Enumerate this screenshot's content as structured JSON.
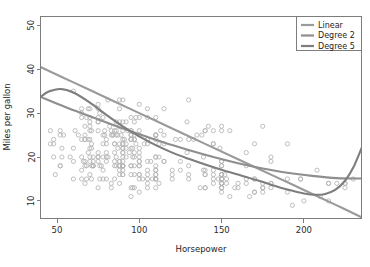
{
  "chart_data": {
    "type": "scatter",
    "title": "",
    "xlabel": "Horsepower",
    "ylabel": "Miles per gallon",
    "xlim": [
      40,
      235
    ],
    "ylim": [
      6,
      52
    ],
    "xticks": [
      50,
      100,
      150,
      200
    ],
    "yticks": [
      10,
      20,
      30,
      40,
      50
    ],
    "xtick_labels": [
      "50",
      "100",
      "150",
      "200"
    ],
    "ytick_labels": [
      "10",
      "20",
      "30",
      "40",
      "50"
    ],
    "grid": false,
    "legend_position": "top-right",
    "point_style": "open-circle",
    "point_color": "#b4b4b4",
    "scatter": {
      "name": "Auto observations",
      "x": [
        130,
        165,
        150,
        150,
        140,
        198,
        220,
        215,
        225,
        190,
        170,
        160,
        150,
        225,
        95,
        95,
        97,
        85,
        88,
        46,
        87,
        90,
        95,
        113,
        90,
        215,
        200,
        210,
        193,
        88,
        90,
        95,
        100,
        105,
        100,
        88,
        100,
        165,
        175,
        153,
        150,
        180,
        170,
        175,
        110,
        72,
        100,
        88,
        86,
        90,
        70,
        76,
        65,
        69,
        60,
        70,
        95,
        80,
        54,
        90,
        86,
        165,
        175,
        150,
        153,
        150,
        208,
        155,
        160,
        190,
        97,
        150,
        130,
        140,
        150,
        112,
        76,
        87,
        69,
        86,
        92,
        97,
        80,
        88,
        175,
        150,
        145,
        137,
        150,
        198,
        150,
        158,
        150,
        215,
        225,
        175,
        105,
        100,
        100,
        88,
        95,
        46,
        150,
        167,
        170,
        180,
        100,
        88,
        72,
        94,
        90,
        85,
        107,
        90,
        145,
        230,
        49,
        75,
        91,
        112,
        150,
        110,
        122,
        180,
        95,
        100,
        100,
        67,
        80,
        65,
        75,
        100,
        110,
        105,
        140,
        150,
        150,
        140,
        150,
        83,
        67,
        78,
        52,
        61,
        75,
        75,
        75,
        97,
        93,
        67,
        95,
        105,
        72,
        72,
        170,
        145,
        150,
        148,
        110,
        105,
        110,
        95,
        110,
        110,
        129,
        75,
        83,
        100,
        78,
        96,
        71,
        97,
        97,
        70,
        90,
        95,
        88,
        98,
        115,
        53,
        86,
        81,
        92,
        79,
        83,
        140,
        150,
        120,
        152,
        100,
        105,
        81,
        90,
        52,
        60,
        70,
        53,
        100,
        78,
        110,
        95,
        71,
        70,
        75,
        72,
        102,
        150,
        88,
        108,
        120,
        180,
        145,
        130,
        150,
        68,
        80,
        58,
        96,
        70,
        145,
        110,
        145,
        130,
        110,
        105,
        100,
        98,
        180,
        170,
        190,
        149,
        78,
        88,
        75,
        89,
        63,
        83,
        67,
        78,
        97,
        110,
        110,
        48,
        66,
        52,
        70,
        60,
        110,
        140,
        139,
        105,
        95,
        85,
        88,
        100,
        90,
        105,
        85,
        110,
        120,
        145,
        165,
        139,
        140,
        68,
        95,
        97,
        75,
        95,
        105,
        85,
        97,
        103,
        125,
        115,
        133,
        71,
        68,
        115,
        85,
        88,
        90,
        110,
        130,
        129,
        138,
        135,
        155,
        142,
        125,
        150,
        71,
        65,
        80,
        80,
        77,
        125,
        71,
        90,
        70,
        70,
        65,
        69,
        90,
        115,
        115,
        90,
        76,
        60,
        70,
        65,
        90,
        88,
        90,
        90,
        78,
        90,
        75,
        92,
        75,
        65,
        105,
        65,
        48,
        48,
        67,
        67,
        67,
        110,
        85,
        92,
        112,
        96,
        84,
        90,
        86,
        52,
        84,
        79,
        82
      ],
      "y": [
        18,
        15,
        18,
        16,
        17,
        15,
        14,
        14,
        14,
        15,
        15,
        14,
        15,
        14,
        24,
        22,
        18,
        21,
        27,
        26,
        25,
        24,
        25,
        26,
        21,
        10,
        10,
        11,
        9,
        27,
        28,
        25,
        25,
        19,
        16,
        17,
        19,
        18,
        14,
        14,
        14,
        14,
        12,
        13,
        13,
        18,
        22,
        19,
        18,
        23,
        28,
        30,
        30,
        31,
        35,
        27,
        26,
        24,
        25,
        23,
        20,
        21,
        13,
        14,
        15,
        14,
        17,
        11,
        13,
        12,
        13,
        19,
        15,
        13,
        13,
        14,
        18,
        22,
        21,
        26,
        22,
        28,
        23,
        28,
        27,
        13,
        14,
        13,
        14,
        15,
        12,
        13,
        13,
        14,
        13,
        12,
        13,
        18,
        16,
        18,
        18,
        23,
        26,
        11,
        12,
        13,
        12,
        18,
        20,
        21,
        22,
        18,
        19,
        21,
        26,
        15,
        16,
        29,
        24,
        20,
        19,
        15,
        24,
        20,
        11,
        20,
        21,
        19,
        15,
        31,
        26,
        32,
        25,
        16,
        16,
        18,
        16,
        13,
        14,
        14,
        14,
        29,
        26,
        26,
        31,
        32,
        28,
        24,
        26,
        24,
        26,
        31,
        19,
        18,
        15,
        15,
        16,
        15,
        16,
        14,
        17,
        16,
        15,
        18,
        21,
        20,
        13,
        29,
        23,
        20,
        23,
        24,
        25,
        24,
        18,
        29,
        19,
        23,
        23,
        22,
        25,
        33,
        28,
        25,
        25,
        26,
        27,
        17,
        16,
        15,
        17,
        20,
        19,
        18,
        19,
        22,
        20,
        26,
        20,
        24,
        24,
        26,
        31,
        19,
        18,
        15,
        15,
        16,
        15,
        16,
        14,
        17,
        16,
        15,
        18,
        21,
        20,
        13,
        29,
        23,
        20,
        23,
        24,
        25,
        24,
        18,
        29,
        19,
        23,
        23,
        22,
        25,
        33,
        28,
        25,
        25,
        26,
        27,
        17,
        16,
        15,
        17,
        20,
        19,
        18,
        19,
        22,
        20,
        26,
        20,
        24,
        24,
        26,
        31,
        19,
        18,
        15,
        15,
        16,
        15,
        16,
        14,
        17,
        16,
        15,
        18,
        21,
        20,
        13,
        29,
        23,
        20,
        23,
        24,
        25,
        24,
        18,
        29,
        19,
        23,
        23,
        22,
        25,
        33,
        28,
        25,
        25,
        26,
        27,
        17,
        16,
        15,
        17,
        20,
        19,
        18,
        19,
        22,
        20,
        26,
        20,
        24,
        24,
        26,
        31,
        19,
        18,
        15,
        15,
        16,
        15,
        16,
        14,
        17,
        16,
        15,
        18,
        21,
        20,
        13,
        29,
        23,
        20,
        23,
        24,
        25,
        24,
        18,
        29,
        19,
        23,
        23,
        22,
        25,
        33,
        28,
        25,
        25,
        26,
        27,
        17,
        16,
        15,
        17,
        20,
        19,
        18,
        19,
        22,
        20,
        26,
        20,
        24,
        24,
        26,
        31,
        19,
        18,
        15,
        15,
        16,
        15,
        16,
        14,
        17,
        16,
        15,
        18,
        21,
        20
      ]
    },
    "series": [
      {
        "name": "Linear",
        "degree": 1,
        "color": "#9a9a9a",
        "points": [
          [
            40,
            40.5
          ],
          [
            60,
            37.0
          ],
          [
            80,
            33.5
          ],
          [
            100,
            30.0
          ],
          [
            120,
            26.5
          ],
          [
            140,
            23.0
          ],
          [
            160,
            19.5
          ],
          [
            180,
            16.0
          ],
          [
            200,
            12.5
          ],
          [
            220,
            9.0
          ],
          [
            235,
            6.3
          ]
        ]
      },
      {
        "name": "Degree 2",
        "degree": 2,
        "color": "#8e8e8e",
        "points": [
          [
            40,
            33.7
          ],
          [
            55,
            31.4
          ],
          [
            70,
            29.3
          ],
          [
            85,
            27.2
          ],
          [
            100,
            25.2
          ],
          [
            115,
            23.3
          ],
          [
            130,
            21.6
          ],
          [
            145,
            20.0
          ],
          [
            160,
            18.6
          ],
          [
            175,
            17.4
          ],
          [
            190,
            16.4
          ],
          [
            205,
            15.7
          ],
          [
            220,
            15.2
          ],
          [
            235,
            15.1
          ]
        ]
      },
      {
        "name": "Degree 5",
        "degree": 5,
        "color": "#7e7e7e",
        "points": [
          [
            40,
            33.7
          ],
          [
            45,
            34.9
          ],
          [
            52,
            35.5
          ],
          [
            60,
            34.7
          ],
          [
            70,
            32.4
          ],
          [
            80,
            29.6
          ],
          [
            90,
            27.0
          ],
          [
            100,
            24.7
          ],
          [
            110,
            22.7
          ],
          [
            120,
            21.0
          ],
          [
            130,
            19.6
          ],
          [
            140,
            18.3
          ],
          [
            150,
            17.1
          ],
          [
            160,
            16.0
          ],
          [
            170,
            14.9
          ],
          [
            180,
            13.7
          ],
          [
            190,
            12.6
          ],
          [
            200,
            11.7
          ],
          [
            207,
            11.4
          ],
          [
            213,
            11.6
          ],
          [
            219,
            12.5
          ],
          [
            225,
            14.6
          ],
          [
            230,
            17.6
          ],
          [
            235,
            22.0
          ]
        ]
      }
    ]
  },
  "legend": {
    "items": [
      {
        "label": "Linear"
      },
      {
        "label": "Degree 2"
      },
      {
        "label": "Degree 5"
      }
    ]
  }
}
